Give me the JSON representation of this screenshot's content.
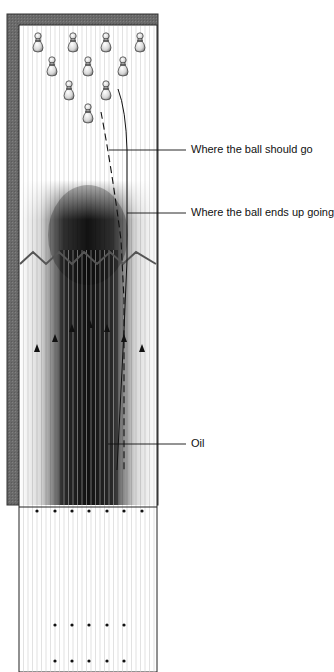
{
  "labels": {
    "should_go": "Where the ball should go",
    "ends_up": "Where the ball ends up going",
    "oil": "Oil"
  },
  "legend": {
    "dashed_line": "Where the ball should go",
    "solid_line": "Where the ball ends up going"
  },
  "elements": {
    "pins": 10,
    "arrows": 7,
    "foul_line_dots": 7,
    "approach_dot_rows": 2,
    "approach_dots_per_row": 5
  },
  "colors": {
    "gutter": "#6e6e6e",
    "lane": "#ffffff",
    "board_line": "#c8c8c8",
    "oil_dark": "#1a1a1a",
    "text": "#111111"
  }
}
